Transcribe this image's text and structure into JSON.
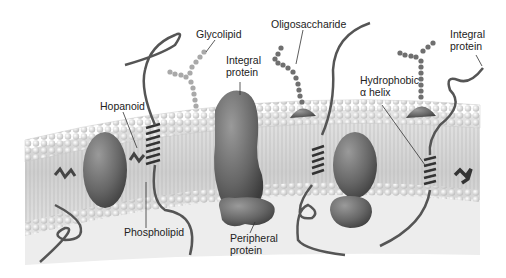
{
  "labels": {
    "glycolipid": "Glycolipid",
    "oligosaccharide": "Oligosaccharide",
    "integral_protein_left": [
      "Integral",
      "protein"
    ],
    "integral_protein_right": [
      "Integral",
      "protein"
    ],
    "hopanoid": "Hopanoid",
    "hydrophobic_helix": [
      "Hydrophobic",
      "α helix"
    ],
    "phospholipid": "Phospholipid",
    "peripheral_protein": [
      "Peripheral",
      "protein"
    ]
  },
  "colors": {
    "membrane_background": "#dcdcdc",
    "phospholipid_head": "#f2f2f2",
    "protein": "#6e6e6e",
    "protein_dark": "#4a4a4a",
    "sugar_chain": "#8a8a8a",
    "label_text": "#222222"
  }
}
